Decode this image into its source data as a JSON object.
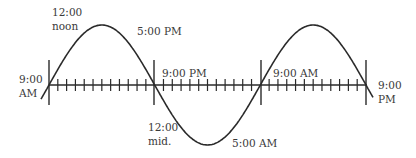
{
  "diagram": {
    "type": "tide-cycle-sine",
    "line_color": "#2a2a2a",
    "text_color": "#3a3a3a",
    "axis": {
      "ticks_per_segment": 11,
      "segments": 3
    },
    "labels": {
      "noon_time": "12:00",
      "noon_word": "noon",
      "pm5": "5:00 PM",
      "left_am9_time": "9:00",
      "left_am9_period": "AM",
      "mid_pm9": "9:00 PM",
      "midnight_time": "12:00",
      "midnight_word": "mid.",
      "am5": "5:00 AM",
      "mid_am9": "9:00 AM",
      "right_pm9_time": "9:00",
      "right_pm9_period": "PM"
    }
  }
}
